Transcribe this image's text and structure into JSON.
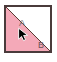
{
  "canvas": {
    "width": 57,
    "height": 62,
    "background_color": "#ffffff"
  },
  "shape": {
    "name": "square-divided-by-diagonal",
    "border_color": "#4a3b3b",
    "diagonal_color": "#5a3b34",
    "diagonal_direction": "bottom-left-to-top-right",
    "regions": [
      {
        "id": "A",
        "label": "A",
        "position": "upper-left",
        "fill_color": "#ffffff",
        "label_color": "#6b6b6b"
      },
      {
        "id": "B",
        "label": "B",
        "position": "lower-right",
        "fill_color": "#f4a9b8",
        "label_color": "#6a5558"
      }
    ]
  },
  "cursor": {
    "icon": "mouse-pointer-arrow-icon",
    "color": "#000000",
    "outline_color": "#ffffff",
    "x": 19,
    "y": 29,
    "direction": "up-left"
  }
}
